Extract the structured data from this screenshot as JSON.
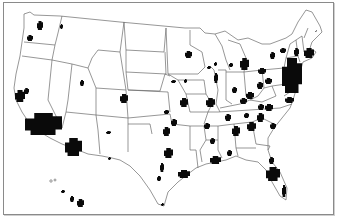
{
  "map": {
    "type": "choropleth-binary",
    "region": "United States (contiguous + Hawaii)",
    "colors": {
      "background": "#ffffff",
      "state_outline": "#6a6a6a",
      "highlighted_area": "#0a0a0a",
      "frame": "#8a8a8a"
    },
    "legend": null,
    "title": null
  },
  "metros": [
    {
      "id": "seattle",
      "x": 37,
      "y": 21,
      "w": 6,
      "h": 9
    },
    {
      "id": "spokane",
      "x": 60,
      "y": 24,
      "w": 3,
      "h": 5
    },
    {
      "id": "portland",
      "x": 27,
      "y": 35,
      "w": 6,
      "h": 6
    },
    {
      "id": "bay-area",
      "x": 15,
      "y": 90,
      "w": 10,
      "h": 12
    },
    {
      "id": "sacramento",
      "x": 24,
      "y": 88,
      "w": 5,
      "h": 6
    },
    {
      "id": "la-socal",
      "x": 25,
      "y": 113,
      "w": 37,
      "h": 22
    },
    {
      "id": "phoenix",
      "x": 65,
      "y": 138,
      "w": 17,
      "h": 18
    },
    {
      "id": "salt-lake",
      "x": 80,
      "y": 80,
      "w": 4,
      "h": 6
    },
    {
      "id": "denver",
      "x": 120,
      "y": 94,
      "w": 8,
      "h": 9
    },
    {
      "id": "albuquerque",
      "x": 106,
      "y": 131,
      "w": 5,
      "h": 3
    },
    {
      "id": "el-paso",
      "x": 108,
      "y": 157,
      "w": 3,
      "h": 3
    },
    {
      "id": "minneapolis",
      "x": 185,
      "y": 51,
      "w": 7,
      "h": 7
    },
    {
      "id": "omaha",
      "x": 171,
      "y": 80,
      "w": 5,
      "h": 3
    },
    {
      "id": "des-moines",
      "x": 184,
      "y": 79,
      "w": 3,
      "h": 4
    },
    {
      "id": "kansas-city",
      "x": 180,
      "y": 98,
      "w": 8,
      "h": 9
    },
    {
      "id": "wichita",
      "x": 164,
      "y": 110,
      "w": 5,
      "h": 4
    },
    {
      "id": "tulsa",
      "x": 171,
      "y": 119,
      "w": 6,
      "h": 7
    },
    {
      "id": "okc",
      "x": 163,
      "y": 127,
      "w": 7,
      "h": 9
    },
    {
      "id": "dallas",
      "x": 164,
      "y": 148,
      "w": 9,
      "h": 10
    },
    {
      "id": "austin",
      "x": 160,
      "y": 163,
      "w": 4,
      "h": 9
    },
    {
      "id": "houston",
      "x": 178,
      "y": 170,
      "w": 12,
      "h": 8
    },
    {
      "id": "san-antonio",
      "x": 157,
      "y": 176,
      "w": 4,
      "h": 5
    },
    {
      "id": "corpus",
      "x": 161,
      "y": 203,
      "w": 3,
      "h": 3
    },
    {
      "id": "chicago",
      "x": 214,
      "y": 73,
      "w": 4,
      "h": 10
    },
    {
      "id": "milwaukee",
      "x": 214,
      "y": 62,
      "w": 3,
      "h": 4
    },
    {
      "id": "madison",
      "x": 207,
      "y": 66,
      "w": 4,
      "h": 3
    },
    {
      "id": "detroit",
      "x": 240,
      "y": 58,
      "w": 9,
      "h": 12
    },
    {
      "id": "grand-rapids",
      "x": 229,
      "y": 63,
      "w": 4,
      "h": 4
    },
    {
      "id": "indianapolis",
      "x": 232,
      "y": 87,
      "w": 5,
      "h": 6
    },
    {
      "id": "st-louis",
      "x": 206,
      "y": 98,
      "w": 9,
      "h": 9
    },
    {
      "id": "louisville",
      "x": 240,
      "y": 98,
      "w": 7,
      "h": 6
    },
    {
      "id": "cincinnati",
      "x": 246,
      "y": 92,
      "w": 8,
      "h": 7
    },
    {
      "id": "columbus",
      "x": 257,
      "y": 82,
      "w": 6,
      "h": 7
    },
    {
      "id": "pittsburgh",
      "x": 265,
      "y": 78,
      "w": 7,
      "h": 6
    },
    {
      "id": "cleveland",
      "x": 258,
      "y": 68,
      "w": 8,
      "h": 6
    },
    {
      "id": "buffalo",
      "x": 270,
      "y": 52,
      "w": 5,
      "h": 7
    },
    {
      "id": "rochester",
      "x": 280,
      "y": 48,
      "w": 6,
      "h": 5
    },
    {
      "id": "albany",
      "x": 294,
      "y": 48,
      "w": 5,
      "h": 8
    },
    {
      "id": "boston",
      "x": 304,
      "y": 48,
      "w": 10,
      "h": 10
    },
    {
      "id": "nyc-phil-dc",
      "x": 282,
      "y": 58,
      "w": 20,
      "h": 35
    },
    {
      "id": "norfolk",
      "x": 285,
      "y": 97,
      "w": 9,
      "h": 6
    },
    {
      "id": "bangor",
      "x": 315,
      "y": 30,
      "w": 2,
      "h": 2
    },
    {
      "id": "nashville",
      "x": 225,
      "y": 114,
      "w": 6,
      "h": 7
    },
    {
      "id": "memphis",
      "x": 204,
      "y": 123,
      "w": 6,
      "h": 6
    },
    {
      "id": "knoxville",
      "x": 244,
      "y": 113,
      "w": 5,
      "h": 5
    },
    {
      "id": "charlotte",
      "x": 257,
      "y": 113,
      "w": 7,
      "h": 9
    },
    {
      "id": "raleigh",
      "x": 265,
      "y": 104,
      "w": 8,
      "h": 7
    },
    {
      "id": "greensboro",
      "x": 258,
      "y": 104,
      "w": 6,
      "h": 6
    },
    {
      "id": "birmingham",
      "x": 232,
      "y": 126,
      "w": 8,
      "h": 10
    },
    {
      "id": "atlanta",
      "x": 247,
      "y": 122,
      "w": 9,
      "h": 9
    },
    {
      "id": "columbia",
      "x": 270,
      "y": 123,
      "w": 6,
      "h": 6
    },
    {
      "id": "jackson",
      "x": 210,
      "y": 138,
      "w": 5,
      "h": 6
    },
    {
      "id": "new-orleans",
      "x": 210,
      "y": 156,
      "w": 11,
      "h": 8
    },
    {
      "id": "mobile",
      "x": 227,
      "y": 150,
      "w": 5,
      "h": 6
    },
    {
      "id": "jacksonville",
      "x": 269,
      "y": 157,
      "w": 5,
      "h": 7
    },
    {
      "id": "tampa-orlando",
      "x": 266,
      "y": 167,
      "w": 14,
      "h": 14
    },
    {
      "id": "miami",
      "x": 282,
      "y": 185,
      "w": 4,
      "h": 12
    },
    {
      "id": "honolulu",
      "x": 61,
      "y": 190,
      "w": 4,
      "h": 3
    },
    {
      "id": "maui",
      "x": 70,
      "y": 196,
      "w": 4,
      "h": 6
    },
    {
      "id": "hawaii-big",
      "x": 77,
      "y": 199,
      "w": 7,
      "h": 8
    }
  ]
}
